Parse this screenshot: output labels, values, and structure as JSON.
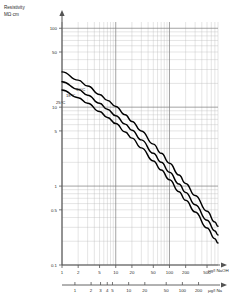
{
  "chart_data": {
    "type": "line",
    "title": "Resistivity",
    "ylabel": "Resistivity",
    "yunit": "MΩ·cm",
    "xlabel_primary": "µg/l NaOH",
    "xlabel_secondary": "µg/l Na",
    "scale": "log-log",
    "grid": true,
    "legend_position": "inline-curve-labels",
    "xlim": [
      1,
      800
    ],
    "ylim": [
      0.1,
      120
    ],
    "yticks": [
      {
        "value": 100,
        "label": "100"
      },
      {
        "value": 50,
        "label": "50"
      },
      {
        "value": 10,
        "label": "10"
      },
      {
        "value": 5,
        "label": "5"
      },
      {
        "value": 1,
        "label": "1"
      },
      {
        "value": 0.5,
        "label": "0.5"
      },
      {
        "value": 0.1,
        "label": "0.1"
      }
    ],
    "xticks_naoh": [
      {
        "value": 1,
        "label": "1"
      },
      {
        "value": 2,
        "label": "2"
      },
      {
        "value": 5,
        "label": "5"
      },
      {
        "value": 10,
        "label": "10"
      },
      {
        "value": 20,
        "label": "20"
      },
      {
        "value": 50,
        "label": "50"
      },
      {
        "value": 100,
        "label": "100"
      },
      {
        "value": 200,
        "label": "200"
      },
      {
        "value": 500,
        "label": "500"
      }
    ],
    "xticks_na": [
      {
        "value": 1,
        "label": "1"
      },
      {
        "value": 2,
        "label": "2"
      },
      {
        "value": 3,
        "label": "3"
      },
      {
        "value": 4,
        "label": "4"
      },
      {
        "value": 5,
        "label": "5"
      },
      {
        "value": 10,
        "label": "10"
      },
      {
        "value": 20,
        "label": "20"
      },
      {
        "value": 50,
        "label": "50"
      },
      {
        "value": 100,
        "label": "100"
      },
      {
        "value": 200,
        "label": "200"
      },
      {
        "value": 500,
        "label": "500"
      }
    ],
    "series": [
      {
        "name": "10°C",
        "label": "10°C",
        "label_x": 76,
        "label_y": 91,
        "points": [
          [
            1,
            28
          ],
          [
            2,
            22
          ],
          [
            3,
            18.5
          ],
          [
            5,
            14.5
          ],
          [
            7,
            12.2
          ],
          [
            10,
            10.2
          ],
          [
            15,
            8.0
          ],
          [
            20,
            6.6
          ],
          [
            30,
            5.0
          ],
          [
            50,
            3.4
          ],
          [
            70,
            2.6
          ],
          [
            100,
            1.95
          ],
          [
            150,
            1.38
          ],
          [
            200,
            1.08
          ],
          [
            300,
            0.76
          ],
          [
            500,
            0.48
          ],
          [
            700,
            0.35
          ],
          [
            800,
            0.31
          ]
        ]
      },
      {
        "name": "18°C",
        "label": "18°C",
        "label_x": 66,
        "label_y": 97,
        "points": [
          [
            1,
            21
          ],
          [
            2,
            16.8
          ],
          [
            3,
            14.2
          ],
          [
            5,
            11.2
          ],
          [
            7,
            9.4
          ],
          [
            10,
            7.8
          ],
          [
            15,
            6.1
          ],
          [
            20,
            5.1
          ],
          [
            30,
            3.85
          ],
          [
            50,
            2.6
          ],
          [
            70,
            2.0
          ],
          [
            100,
            1.5
          ],
          [
            150,
            1.06
          ],
          [
            200,
            0.83
          ],
          [
            300,
            0.58
          ],
          [
            500,
            0.37
          ],
          [
            700,
            0.27
          ],
          [
            800,
            0.24
          ]
        ]
      },
      {
        "name": "25°C",
        "label": "25°C",
        "label_x": 56,
        "label_y": 104,
        "points": [
          [
            1,
            16.5
          ],
          [
            2,
            13.2
          ],
          [
            3,
            11.2
          ],
          [
            5,
            8.8
          ],
          [
            7,
            7.4
          ],
          [
            10,
            6.2
          ],
          [
            15,
            4.85
          ],
          [
            20,
            4.05
          ],
          [
            30,
            3.05
          ],
          [
            50,
            2.08
          ],
          [
            70,
            1.6
          ],
          [
            100,
            1.2
          ],
          [
            150,
            0.85
          ],
          [
            200,
            0.66
          ],
          [
            300,
            0.47
          ],
          [
            500,
            0.295
          ],
          [
            700,
            0.215
          ],
          [
            800,
            0.19
          ]
        ]
      }
    ],
    "colors": {
      "curve": "#000000",
      "grid_minor": "#b9b9b9",
      "grid_major": "#7d7d7d",
      "axis": "#545454",
      "text": "#2b2b2b",
      "background": "#ffffff"
    }
  }
}
